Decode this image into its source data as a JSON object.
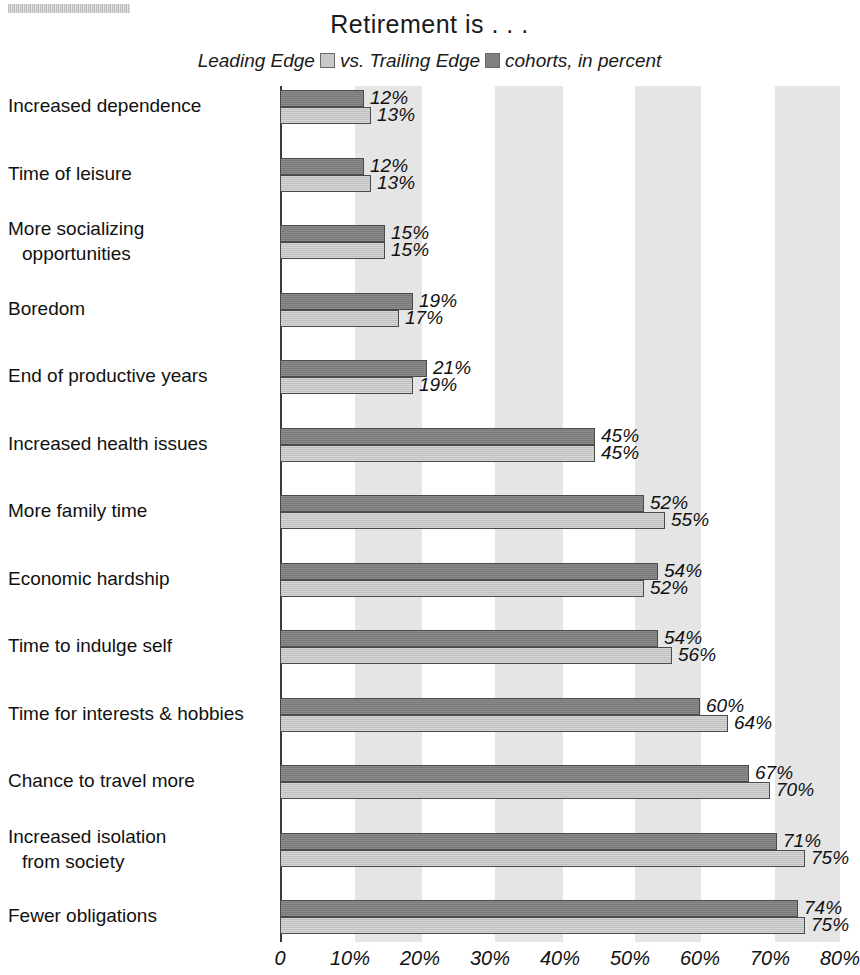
{
  "artifact": {
    "name": "scan-smudge"
  },
  "chart_data": {
    "type": "bar",
    "orientation": "horizontal",
    "title": "Retirement is . . .",
    "subtitle_parts": {
      "pre": "Leading Edge",
      "mid": "vs. Trailing Edge",
      "post": "cohorts, in percent"
    },
    "xlabel": "",
    "ylabel": "",
    "xlim": [
      0,
      80
    ],
    "grid": false,
    "grid_bands": true,
    "legend_position": "top-center",
    "series": [
      {
        "name": "Trailing Edge",
        "color": "#7e7e7e",
        "values": [
          12,
          12,
          15,
          19,
          21,
          45,
          52,
          54,
          54,
          60,
          67,
          71,
          74
        ],
        "labels": [
          "12%",
          "12%",
          "15%",
          "19%",
          "21%",
          "45%",
          "52%",
          "54%",
          "54%",
          "60%",
          "67%",
          "71%",
          "74%"
        ]
      },
      {
        "name": "Leading Edge",
        "color": "#c9c9c9",
        "values": [
          13,
          13,
          15,
          17,
          19,
          45,
          55,
          52,
          56,
          64,
          70,
          75,
          75
        ],
        "labels": [
          "13%",
          "13%",
          "15%",
          "17%",
          "19%",
          "45%",
          "55%",
          "52%",
          "56%",
          "64%",
          "70%",
          "75%",
          "75%"
        ]
      }
    ],
    "categories": [
      {
        "line1": "Increased dependence",
        "line2": ""
      },
      {
        "line1": "Time of leisure",
        "line2": ""
      },
      {
        "line1": "More socializing",
        "line2": "opportunities"
      },
      {
        "line1": "Boredom",
        "line2": ""
      },
      {
        "line1": "End of productive years",
        "line2": ""
      },
      {
        "line1": "Increased health issues",
        "line2": ""
      },
      {
        "line1": "More family time",
        "line2": ""
      },
      {
        "line1": "Economic hardship",
        "line2": ""
      },
      {
        "line1": "Time to indulge self",
        "line2": ""
      },
      {
        "line1": "Time for interests & hobbies",
        "line2": ""
      },
      {
        "line1": "Chance to travel more",
        "line2": ""
      },
      {
        "line1": "Increased isolation",
        "line2": "from society"
      },
      {
        "line1": "Fewer obligations",
        "line2": ""
      }
    ],
    "xticks": [
      0,
      10,
      20,
      30,
      40,
      50,
      60,
      70,
      80
    ],
    "xtick_labels": [
      "0",
      "10%",
      "20%",
      "30%",
      "40%",
      "50%",
      "60%",
      "70%",
      "80%"
    ],
    "band_ranges": [
      [
        10.7,
        20.3
      ],
      [
        30.7,
        40.4
      ],
      [
        50.7,
        60.2
      ],
      [
        70.7,
        80.0
      ]
    ],
    "colors": {
      "leading_edge": "#c9c9c9",
      "trailing_edge": "#7e7e7e",
      "band": "#d5d5d5",
      "axis": "#3a3a3a",
      "text": "#111111"
    }
  }
}
